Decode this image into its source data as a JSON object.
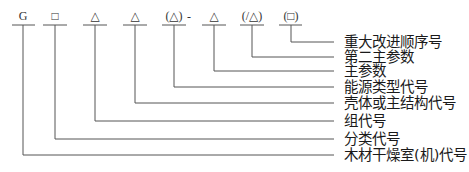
{
  "diagram": {
    "type": "code-structure-diagram",
    "line_color": "#555555",
    "codes": [
      {
        "label": "G",
        "x": 23,
        "y_end": 155
      },
      {
        "label": "□",
        "x": 55,
        "y_end": 139
      },
      {
        "label": "△",
        "x": 95,
        "y_end": 121
      },
      {
        "label": "△",
        "x": 135,
        "y_end": 103
      },
      {
        "label": "(△)",
        "x": 174,
        "y_end": 87
      },
      {
        "label": "△",
        "x": 214,
        "y_end": 71
      },
      {
        "label": "(/△)",
        "x": 252,
        "y_end": 57
      },
      {
        "label": "(□)",
        "x": 291,
        "y_end": 42
      }
    ],
    "separator": "-",
    "descriptions": [
      {
        "text": "重大改进顺序号",
        "y": 42
      },
      {
        "text": "第二主参数",
        "y": 57
      },
      {
        "text": "主参数",
        "y": 71
      },
      {
        "text": "能源类型代号",
        "y": 87
      },
      {
        "text": "壳体或主结构代号",
        "y": 103
      },
      {
        "text": "组代号",
        "y": 121
      },
      {
        "text": "分类代号",
        "y": 139
      },
      {
        "text": "木材干燥室(机)代号",
        "y": 155
      }
    ]
  }
}
